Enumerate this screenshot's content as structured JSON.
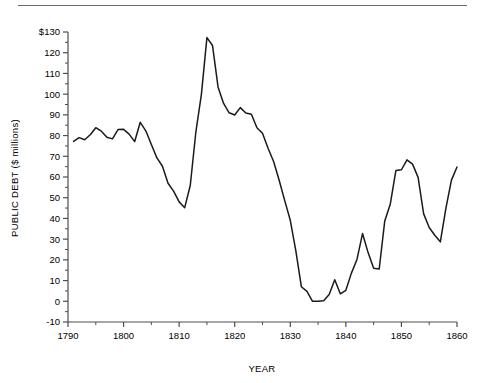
{
  "chart_data": {
    "type": "line",
    "title": "",
    "xlabel": "YEAR",
    "ylabel": "PUBLIC DEBT ($ millions)",
    "xlim": [
      1790,
      1860
    ],
    "ylim": [
      -10,
      130
    ],
    "grid": false,
    "legend": null,
    "x_major_step": 10,
    "x_minor_step": 5,
    "y_major_step": 10,
    "x_tick_labels": [
      "1790",
      "1800",
      "1810",
      "1820",
      "1830",
      "1840",
      "1850",
      "1860"
    ],
    "y_tick_labels": [
      "-10",
      "0",
      "10",
      "20",
      "30",
      "40",
      "50",
      "60",
      "70",
      "80",
      "90",
      "100",
      "110",
      "120",
      "$130"
    ],
    "line_color": "#1a1a1a",
    "axis_color": "#4d4d4d",
    "series": [
      {
        "name": "Public debt",
        "x": [
          1791,
          1792,
          1793,
          1794,
          1795,
          1796,
          1797,
          1798,
          1799,
          1800,
          1801,
          1802,
          1803,
          1804,
          1805,
          1806,
          1807,
          1808,
          1809,
          1810,
          1811,
          1812,
          1813,
          1814,
          1815,
          1816,
          1817,
          1818,
          1819,
          1820,
          1821,
          1822,
          1823,
          1824,
          1825,
          1826,
          1827,
          1828,
          1829,
          1830,
          1831,
          1832,
          1833,
          1834,
          1835,
          1836,
          1837,
          1838,
          1839,
          1840,
          1841,
          1842,
          1843,
          1844,
          1845,
          1846,
          1847,
          1848,
          1849,
          1850,
          1851,
          1852,
          1853,
          1854,
          1855,
          1856,
          1857,
          1858,
          1859,
          1860
        ],
        "values": [
          77.2,
          79.0,
          78.0,
          80.4,
          83.8,
          82.1,
          79.2,
          78.4,
          82.9,
          83.0,
          80.7,
          77.1,
          86.4,
          82.3,
          75.7,
          69.2,
          65.2,
          57.0,
          53.2,
          48.0,
          45.2,
          55.9,
          81.5,
          99.8,
          127.3,
          123.5,
          103.5,
          95.5,
          91.0,
          89.9,
          93.5,
          90.9,
          90.3,
          83.8,
          81.1,
          73.9,
          67.5,
          58.4,
          48.6,
          39.1,
          24.3,
          7.0,
          4.8,
          0.0,
          0.0,
          0.3,
          3.3,
          10.4,
          3.6,
          5.3,
          13.6,
          20.2,
          32.7,
          23.5,
          15.9,
          15.6,
          38.8,
          47.0,
          63.1,
          63.5,
          68.3,
          66.2,
          59.8,
          42.2,
          35.6,
          31.9,
          28.7,
          44.9,
          58.5,
          64.8
        ]
      }
    ],
    "annotations": []
  },
  "axis_labels": {
    "x_title": "YEAR",
    "y_title": "PUBLIC DEBT ($ millions)"
  }
}
